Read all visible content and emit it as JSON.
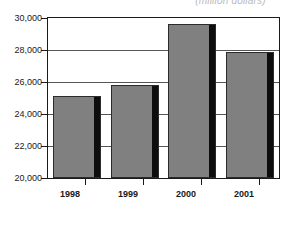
{
  "chart_data": {
    "type": "bar",
    "title": "(million dollars)",
    "xlabel": "",
    "ylabel": "",
    "categories": [
      "1998",
      "1999",
      "2000",
      "2001"
    ],
    "values": [
      25100,
      25800,
      29600,
      27850
    ],
    "ylim": [
      20000,
      30000
    ],
    "ytick_labels": [
      "30,000",
      "28,000",
      "26,000",
      "24,000",
      "22,000",
      "20,000"
    ],
    "ytick_values": [
      30000,
      28000,
      26000,
      24000,
      22000,
      20000
    ],
    "grid": true,
    "legend": "none",
    "series": [
      {
        "name": "value",
        "values": [
          25100,
          25800,
          29600,
          27850
        ]
      }
    ],
    "colors": {
      "bar_fill": "#808080",
      "bar_shadow": "#0d0d0d",
      "bar_outline": "#2b2b2b",
      "axis": "#1a1a1a",
      "gridline": "#555555",
      "background": "#ffffff",
      "title_text": "#b9b9b9"
    }
  }
}
